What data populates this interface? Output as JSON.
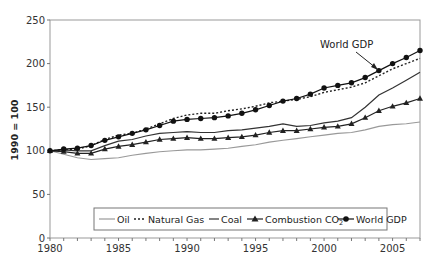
{
  "chart_data": {
    "type": "line",
    "title": "",
    "xlabel": "",
    "ylabel": "1990 = 100",
    "xlim": [
      1980,
      2007
    ],
    "ylim": [
      0,
      250
    ],
    "yticks": [
      0,
      50,
      100,
      150,
      200,
      250
    ],
    "xticks": [
      1980,
      1985,
      1990,
      1995,
      2000,
      2005
    ],
    "grid": false,
    "legend_position": "bottom-inside",
    "x": [
      1980,
      1981,
      1982,
      1983,
      1984,
      1985,
      1986,
      1987,
      1988,
      1989,
      1990,
      1991,
      1992,
      1993,
      1994,
      1995,
      1996,
      1997,
      1998,
      1999,
      2000,
      2001,
      2002,
      2003,
      2004,
      2005,
      2006,
      2007
    ],
    "series": [
      {
        "name": "Oil",
        "style": "solid-light",
        "color": "#999999",
        "values": [
          100,
          96,
          92,
          90,
          91,
          92,
          95,
          97,
          99,
          100,
          101,
          101,
          102,
          103,
          105,
          107,
          110,
          112,
          114,
          116,
          118,
          120,
          121,
          124,
          128,
          130,
          131,
          133
        ]
      },
      {
        "name": "Natural Gas",
        "style": "dotted",
        "color": "#222222",
        "values": [
          100,
          101,
          102,
          106,
          113,
          118,
          120,
          125,
          131,
          137,
          141,
          143,
          143,
          146,
          148,
          151,
          155,
          157,
          159,
          162,
          167,
          170,
          173,
          178,
          186,
          194,
          200,
          206
        ]
      },
      {
        "name": "Coal",
        "style": "solid",
        "color": "#333333",
        "values": [
          100,
          101,
          100,
          100,
          106,
          111,
          113,
          117,
          120,
          121,
          122,
          121,
          121,
          123,
          124,
          126,
          128,
          131,
          128,
          129,
          132,
          134,
          138,
          150,
          164,
          172,
          181,
          190
        ]
      },
      {
        "name": "Combustion CO2",
        "style": "solid-triangle",
        "color": "#222222",
        "values": [
          100,
          99,
          97,
          97,
          102,
          105,
          107,
          110,
          113,
          114,
          115,
          114,
          114,
          115,
          116,
          118,
          121,
          123,
          123,
          125,
          127,
          128,
          131,
          138,
          146,
          151,
          155,
          160
        ]
      },
      {
        "name": "World GDP",
        "style": "solid-circle",
        "color": "#111111",
        "values": [
          100,
          102,
          103,
          106,
          112,
          116,
          120,
          124,
          129,
          134,
          136,
          137,
          138,
          140,
          143,
          147,
          152,
          157,
          160,
          165,
          172,
          175,
          178,
          184,
          192,
          200,
          207,
          215
        ]
      }
    ],
    "annotations": [
      {
        "text": "World GDP",
        "x": 2005,
        "y": 205
      }
    ]
  },
  "legend": {
    "oil": "Oil",
    "gas": "Natural Gas",
    "coal": "Coal",
    "co2": "Combustion CO",
    "co2_sub": "2",
    "gdp": "World GDP"
  },
  "annotation_text": "World GDP",
  "ylabel": "1990 = 100"
}
